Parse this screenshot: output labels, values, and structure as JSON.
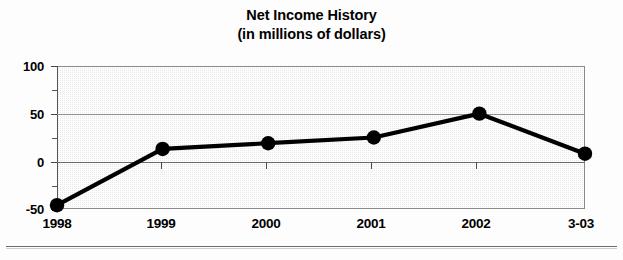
{
  "chart_data": {
    "type": "line",
    "title": "Net Income History",
    "subtitle": "(in millions of dollars)",
    "xlabel": "",
    "ylabel": "",
    "categories": [
      "1998",
      "1999",
      "2000",
      "2001",
      "2002",
      "3-03"
    ],
    "values": [
      -46,
      13,
      19,
      25,
      50,
      8
    ],
    "series": [
      {
        "name": "Net Income",
        "values": [
          -46,
          13,
          19,
          25,
          50,
          8
        ]
      }
    ],
    "ylim": [
      -50,
      100
    ],
    "y_ticks": [
      100,
      50,
      0,
      -50
    ],
    "y_tick_labels": [
      "100",
      "50",
      "0",
      "-50"
    ],
    "y_minor_ticks": [
      75,
      25,
      -25
    ],
    "grid": true,
    "grid_axis": "y",
    "legend": false,
    "marker": "filled-circle",
    "line_color": "#000000",
    "marker_color": "#000000",
    "plot_background": "#e9e9e9",
    "plot_border_color": "#8a8a8a",
    "gridline_color": "#8e8e8e"
  },
  "title": {
    "line1": "Net Income History",
    "line2": "(in millions of dollars)"
  },
  "axes": {
    "y_labels": [
      "100",
      "50",
      "0",
      "-50"
    ],
    "x_labels": [
      "1998",
      "1999",
      "2000",
      "2001",
      "2002",
      "3-03"
    ]
  }
}
